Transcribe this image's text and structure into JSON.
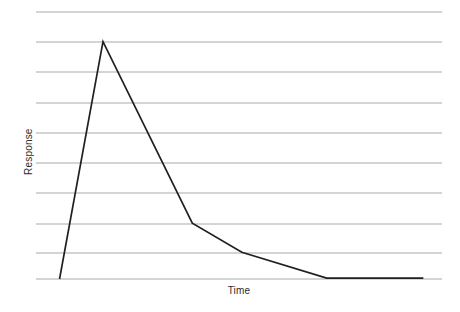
{
  "chart_data": {
    "type": "line",
    "title": "",
    "subtitle": "",
    "xlabel": "Time",
    "ylabel": "Response",
    "grid": true,
    "grid_orientation": "horizontal",
    "gridline_count": 10,
    "legend": false,
    "legend_position": "none",
    "annotations": [],
    "xlim": [
      0,
      10
    ],
    "ylim": [
      0,
      9
    ],
    "x_tick_labels": [],
    "y_tick_labels": [],
    "series": [
      {
        "name": "Response",
        "color": "#231f20",
        "x": [
          0.58,
          1.65,
          3.85,
          5.07,
          7.16,
          9.54
        ],
        "y": [
          0.0,
          8.0,
          1.88,
          0.9,
          0.03,
          0.03
        ],
        "points": [
          {
            "label": "onset",
            "x": 0.58,
            "y": 0.0
          },
          {
            "label": "peak",
            "x": 1.65,
            "y": 8.0
          },
          {
            "label": "rapid-decay-end",
            "x": 3.85,
            "y": 1.88
          },
          {
            "label": "slow-decay-knee",
            "x": 5.07,
            "y": 0.9
          },
          {
            "label": "baseline-return",
            "x": 7.16,
            "y": 0.03
          },
          {
            "label": "end",
            "x": 9.54,
            "y": 0.03
          }
        ]
      }
    ],
    "gridline_values": [
      8.9,
      7.9,
      6.9,
      5.88,
      4.88,
      3.88,
      2.88,
      1.85,
      0.88,
      0.03
    ],
    "colors": {
      "line": "#231f20",
      "grid": "#a7a9ac",
      "background": "#ffffff",
      "text": "#2b2b2b"
    }
  },
  "figure": {
    "y_axis_label": "Response",
    "x_axis_label": "Time"
  }
}
